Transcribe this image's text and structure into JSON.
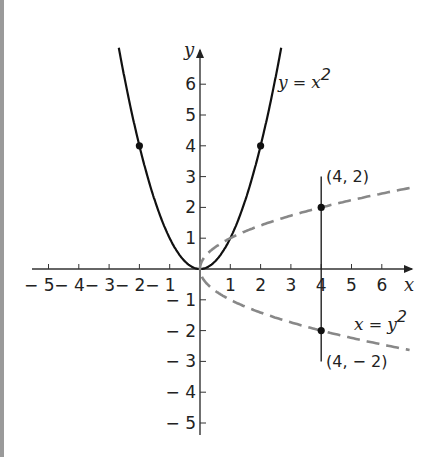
{
  "chart_data": {
    "type": "line",
    "title": "",
    "xlabel": "x",
    "ylabel": "y",
    "xlim": [
      -5.5,
      7
    ],
    "ylim": [
      -5.5,
      7
    ],
    "grid": false,
    "x_ticks": [
      "− 5",
      "− 4",
      "− 3",
      "− 2",
      "− 1",
      "1",
      "2",
      "3",
      "4",
      "5",
      "6"
    ],
    "y_ticks_pos": [
      "1",
      "2",
      "3",
      "4",
      "5",
      "6"
    ],
    "y_ticks_neg": [
      "− 1",
      "− 2",
      "− 3",
      "− 4",
      "− 5"
    ],
    "series": [
      {
        "name": "y = x^2",
        "style": "solid",
        "color": "#111111",
        "x": [
          -2.68,
          -2,
          -1,
          0,
          1,
          2,
          2.68
        ],
        "y": [
          7.2,
          4,
          1,
          0,
          1,
          4,
          7.2
        ],
        "marked_points": [
          [
            -2,
            4
          ],
          [
            2,
            4
          ]
        ]
      },
      {
        "name": "x = y^2",
        "style": "dashed",
        "color": "#888888",
        "x": [
          0,
          1,
          4,
          6.9
        ],
        "y_upper": [
          0,
          1,
          2,
          2.63
        ],
        "y_lower": [
          0,
          -1,
          -2,
          -2.63
        ],
        "marked_points": [
          [
            4,
            2
          ],
          [
            4,
            -2
          ]
        ]
      }
    ],
    "vertical_line": {
      "x": 4,
      "y_from": 3.0,
      "y_to": -3.0
    },
    "annotations": [
      {
        "text_parts": [
          "y",
          " = ",
          "x",
          "2"
        ],
        "label": "y = x²",
        "at": [
          2.5,
          5.8
        ]
      },
      {
        "text_parts": [
          "x",
          " = ",
          "y",
          "2"
        ],
        "label": "x = y²",
        "at": [
          4.8,
          -2.0
        ]
      },
      {
        "label": "(4, 2)",
        "at": [
          4.3,
          3.0
        ]
      },
      {
        "label": "(4, − 2)",
        "at": [
          4.3,
          -3.0
        ]
      }
    ]
  }
}
